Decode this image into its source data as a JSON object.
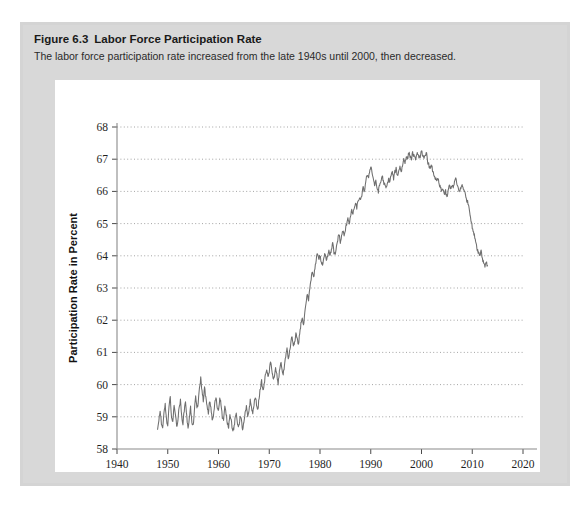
{
  "figure": {
    "label": "Figure 6.3",
    "title": "Labor Force Participation Rate",
    "subtitle": "The labor force participation rate increased from the late 1940s until 2000, then decreased."
  },
  "colors": {
    "panel_background": "#d4d4d4",
    "plot_background": "#ffffff",
    "line": "#6e6e6e",
    "gridline": "#9a9a9a",
    "axis": "#8a8a8a",
    "text": "#1a1a1a"
  },
  "chart_data": {
    "type": "line",
    "title": "Labor Force Participation Rate",
    "xlabel": "Year",
    "ylabel": "Participation Rate in Percent",
    "xlim": [
      1940,
      2020
    ],
    "ylim": [
      58,
      68
    ],
    "xticks": [
      1940,
      1950,
      1960,
      1970,
      1980,
      1990,
      2000,
      2010,
      2020
    ],
    "yticks": [
      58,
      59,
      60,
      61,
      62,
      63,
      64,
      65,
      66,
      67,
      68
    ],
    "grid": "horizontal-dotted",
    "legend": "none",
    "series": [
      {
        "name": "Labor force participation rate",
        "x": [
          1948.0,
          1948.25,
          1948.5,
          1948.75,
          1949.0,
          1949.25,
          1949.5,
          1949.75,
          1950.0,
          1950.25,
          1950.5,
          1950.75,
          1951.0,
          1951.25,
          1951.5,
          1951.75,
          1952.0,
          1952.25,
          1952.5,
          1952.75,
          1953.0,
          1953.25,
          1953.5,
          1953.75,
          1954.0,
          1954.25,
          1954.5,
          1954.75,
          1955.0,
          1955.25,
          1955.5,
          1955.75,
          1956.0,
          1956.25,
          1956.5,
          1956.75,
          1957.0,
          1957.25,
          1957.5,
          1957.75,
          1958.0,
          1958.25,
          1958.5,
          1958.75,
          1959.0,
          1959.25,
          1959.5,
          1959.75,
          1960.0,
          1960.25,
          1960.5,
          1960.75,
          1961.0,
          1961.25,
          1961.5,
          1961.75,
          1962.0,
          1962.25,
          1962.5,
          1962.75,
          1963.0,
          1963.25,
          1963.5,
          1963.75,
          1964.0,
          1964.25,
          1964.5,
          1964.75,
          1965.0,
          1965.25,
          1965.5,
          1965.75,
          1966.0,
          1966.25,
          1966.5,
          1966.75,
          1967.0,
          1967.25,
          1967.5,
          1967.75,
          1968.0,
          1968.25,
          1968.5,
          1968.75,
          1969.0,
          1969.25,
          1969.5,
          1969.75,
          1970.0,
          1970.25,
          1970.5,
          1970.75,
          1971.0,
          1971.25,
          1971.5,
          1971.75,
          1972.0,
          1972.25,
          1972.5,
          1972.75,
          1973.0,
          1973.25,
          1973.5,
          1973.75,
          1974.0,
          1974.25,
          1974.5,
          1974.75,
          1975.0,
          1975.25,
          1975.5,
          1975.75,
          1976.0,
          1976.25,
          1976.5,
          1976.75,
          1977.0,
          1977.25,
          1977.5,
          1977.75,
          1978.0,
          1978.25,
          1978.5,
          1978.75,
          1979.0,
          1979.25,
          1979.5,
          1979.75,
          1980.0,
          1980.25,
          1980.5,
          1980.75,
          1981.0,
          1981.25,
          1981.5,
          1981.75,
          1982.0,
          1982.25,
          1982.5,
          1982.75,
          1983.0,
          1983.25,
          1983.5,
          1983.75,
          1984.0,
          1984.25,
          1984.5,
          1984.75,
          1985.0,
          1985.25,
          1985.5,
          1985.75,
          1986.0,
          1986.25,
          1986.5,
          1986.75,
          1987.0,
          1987.25,
          1987.5,
          1987.75,
          1988.0,
          1988.25,
          1988.5,
          1988.75,
          1989.0,
          1989.25,
          1989.5,
          1989.75,
          1990.0,
          1990.25,
          1990.5,
          1990.75,
          1991.0,
          1991.25,
          1991.5,
          1991.75,
          1992.0,
          1992.25,
          1992.5,
          1992.75,
          1993.0,
          1993.25,
          1993.5,
          1993.75,
          1994.0,
          1994.25,
          1994.5,
          1994.75,
          1995.0,
          1995.25,
          1995.5,
          1995.75,
          1996.0,
          1996.25,
          1996.5,
          1996.75,
          1997.0,
          1997.25,
          1997.5,
          1997.75,
          1998.0,
          1998.25,
          1998.5,
          1998.75,
          1999.0,
          1999.25,
          1999.5,
          1999.75,
          2000.0,
          2000.25,
          2000.5,
          2000.75,
          2001.0,
          2001.25,
          2001.5,
          2001.75,
          2002.0,
          2002.25,
          2002.5,
          2002.75,
          2003.0,
          2003.25,
          2003.5,
          2003.75,
          2004.0,
          2004.25,
          2004.5,
          2004.75,
          2005.0,
          2005.25,
          2005.5,
          2005.75,
          2006.0,
          2006.25,
          2006.5,
          2006.75,
          2007.0,
          2007.25,
          2007.5,
          2007.75,
          2008.0,
          2008.25,
          2008.5,
          2008.75,
          2009.0,
          2009.25,
          2009.5,
          2009.75,
          2010.0,
          2010.25,
          2010.5,
          2010.75,
          2011.0,
          2011.25,
          2011.5,
          2011.75,
          2012.0,
          2012.25,
          2012.5,
          2012.75,
          2013.0
        ],
        "y": [
          58.6,
          58.9,
          59.2,
          58.8,
          58.6,
          59.1,
          59.4,
          58.9,
          58.7,
          59.3,
          59.6,
          59.0,
          58.8,
          59.4,
          59.1,
          58.7,
          58.9,
          59.3,
          59.5,
          59.0,
          58.8,
          59.2,
          59.5,
          59.0,
          58.6,
          59.0,
          59.3,
          58.8,
          58.7,
          59.2,
          59.6,
          59.3,
          59.4,
          59.9,
          60.2,
          59.8,
          59.5,
          59.9,
          59.6,
          59.3,
          59.1,
          59.5,
          59.3,
          58.9,
          59.0,
          59.4,
          59.6,
          59.3,
          59.2,
          59.6,
          59.4,
          59.0,
          58.9,
          59.3,
          59.1,
          58.8,
          58.7,
          59.1,
          58.9,
          58.6,
          58.6,
          58.9,
          59.1,
          58.8,
          58.7,
          59.0,
          58.9,
          58.6,
          58.8,
          59.1,
          59.3,
          59.0,
          59.2,
          59.5,
          59.3,
          59.1,
          59.4,
          59.6,
          59.4,
          59.2,
          59.6,
          59.9,
          60.1,
          59.8,
          60.0,
          60.3,
          60.5,
          60.2,
          60.4,
          60.7,
          60.5,
          60.2,
          60.2,
          60.5,
          60.3,
          60.0,
          60.4,
          60.7,
          60.5,
          60.3,
          60.6,
          60.9,
          61.1,
          60.8,
          61.0,
          61.3,
          61.5,
          61.2,
          61.3,
          61.6,
          61.4,
          61.2,
          61.6,
          61.9,
          62.1,
          61.8,
          62.2,
          62.5,
          62.8,
          62.6,
          63.0,
          63.3,
          63.5,
          63.3,
          63.6,
          63.9,
          64.1,
          63.9,
          64.0,
          63.8,
          63.7,
          63.9,
          64.1,
          63.9,
          64.0,
          64.2,
          64.0,
          64.2,
          64.4,
          64.1,
          64.0,
          64.3,
          64.5,
          64.7,
          64.4,
          64.6,
          64.8,
          64.6,
          64.8,
          65.0,
          65.2,
          65.0,
          65.2,
          65.4,
          65.3,
          65.5,
          65.6,
          65.5,
          65.7,
          65.8,
          65.7,
          65.9,
          66.1,
          66.0,
          66.3,
          66.5,
          66.4,
          66.6,
          66.8,
          66.6,
          66.4,
          66.2,
          66.3,
          66.1,
          66.0,
          66.2,
          66.3,
          66.5,
          66.3,
          66.2,
          66.1,
          66.2,
          66.4,
          66.3,
          66.5,
          66.6,
          66.4,
          66.6,
          66.7,
          66.5,
          66.6,
          66.8,
          66.6,
          66.8,
          67.0,
          66.9,
          67.1,
          67.0,
          67.2,
          67.1,
          67.0,
          67.2,
          67.1,
          67.0,
          67.1,
          67.2,
          67.0,
          67.1,
          67.3,
          67.1,
          67.0,
          67.1,
          67.2,
          66.9,
          66.8,
          66.7,
          66.8,
          66.6,
          66.5,
          66.4,
          66.3,
          66.4,
          66.2,
          66.1,
          66.0,
          66.1,
          65.9,
          66.0,
          65.8,
          66.0,
          66.2,
          66.1,
          66.2,
          66.1,
          66.3,
          66.4,
          66.2,
          66.1,
          66.0,
          66.1,
          66.2,
          66.1,
          66.0,
          65.8,
          65.7,
          65.6,
          65.4,
          65.1,
          64.9,
          64.7,
          64.6,
          64.4,
          64.2,
          64.1,
          64.0,
          64.2,
          63.9,
          63.8,
          63.7,
          63.8,
          63.7
        ]
      }
    ],
    "annotations": [
      {
        "text": "Series begins 1948",
        "x": 1948,
        "y": 58.6
      },
      {
        "text": "Peak near 2000",
        "x": 2000,
        "y": 67.3
      },
      {
        "text": "Series ends 2013",
        "x": 2013,
        "y": 63.7
      }
    ]
  }
}
